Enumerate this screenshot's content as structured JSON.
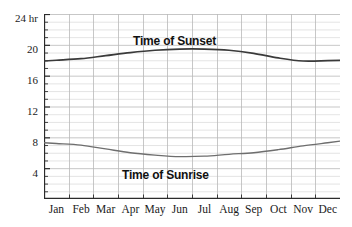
{
  "chart_data": {
    "type": "line",
    "title": "",
    "xlabel": "",
    "ylabel": "24 hr",
    "ylim": [
      0,
      24
    ],
    "yticks": [
      4,
      8,
      12,
      16,
      20,
      24
    ],
    "ytick_labels": [
      "4",
      "8",
      "12",
      "16",
      "20",
      "24 hr"
    ],
    "grid": true,
    "grid_minor_step": 1,
    "grid_major_step": 4,
    "legend_position": "inline-annotation",
    "categories": [
      "Jan",
      "Feb",
      "Mar",
      "Apr",
      "May",
      "Jun",
      "Jul",
      "Aug",
      "Sep",
      "Oct",
      "Nov",
      "Dec"
    ],
    "series": [
      {
        "name": "Time of Sunset",
        "color": "#3a3a3a",
        "values": [
          18.0,
          18.2,
          18.6,
          19.0,
          19.3,
          19.45,
          19.45,
          19.3,
          18.9,
          18.3,
          17.9,
          17.95
        ]
      },
      {
        "name": "Time of Sunrise",
        "color": "#6e6e6e",
        "values": [
          7.2,
          7.0,
          6.5,
          6.0,
          5.7,
          5.5,
          5.55,
          5.8,
          6.0,
          6.4,
          6.9,
          7.3
        ]
      }
    ],
    "annotations": [
      {
        "text": "Time of Sunset",
        "x": "Jun",
        "y": 21.5
      },
      {
        "text": "Time of Sunrise",
        "x": "Jun",
        "y": 3.6
      }
    ]
  },
  "axes": {
    "y_tick_labels": [
      {
        "text": "24 hr",
        "top": 13
      },
      {
        "text": "20",
        "top": 44
      },
      {
        "text": "16",
        "top": 75
      },
      {
        "text": "12",
        "top": 106
      },
      {
        "text": "8",
        "top": 137
      },
      {
        "text": "4",
        "top": 168
      }
    ],
    "x_tick_labels": [
      "Jan",
      "Feb",
      "Mar",
      "Apr",
      "May",
      "Jun",
      "Jul",
      "Aug",
      "Sep",
      "Oct",
      "Nov",
      "Dec"
    ]
  },
  "colors": {
    "background": "#ffffff",
    "axis": "#2b2b2b",
    "grid_minor": "#d9d9d9",
    "grid_major": "#b9b9b9",
    "sunset_line": "#3a3a3a",
    "sunrise_line": "#6e6e6e",
    "text": "#1a1a1a"
  }
}
